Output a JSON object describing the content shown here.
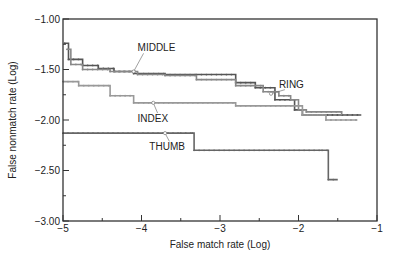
{
  "chart_data": {
    "type": "line",
    "title": "",
    "xlabel": "False match rate (Log)",
    "ylabel": "False nonmatch rate (Log)",
    "xlim": [
      -5,
      -1
    ],
    "ylim": [
      -3.0,
      -1.0
    ],
    "xticks": [
      -5,
      -4,
      -3,
      -2,
      -1
    ],
    "xtick_labels": [
      "−5",
      "−4",
      "−3",
      "−2",
      "−1"
    ],
    "yticks": [
      -1.0,
      -1.5,
      -2.0,
      -2.5,
      -3.0
    ],
    "ytick_labels": [
      "−1.00",
      "−1.50",
      "−2.00",
      "−2.50",
      "−3.00"
    ],
    "grid": false,
    "legend": "none (inline annotations)",
    "series": [
      {
        "name": "MIDDLE",
        "color": "#555555",
        "step": true,
        "points": [
          [
            -4.98,
            -1.24
          ],
          [
            -4.93,
            -1.4
          ],
          [
            -4.75,
            -1.46
          ],
          [
            -4.55,
            -1.49
          ],
          [
            -4.35,
            -1.52
          ],
          [
            -4.1,
            -1.54
          ],
          [
            -3.7,
            -1.55
          ],
          [
            -3.3,
            -1.55
          ],
          [
            -2.8,
            -1.63
          ],
          [
            -2.55,
            -1.68
          ],
          [
            -2.3,
            -1.8
          ],
          [
            -2.05,
            -1.9
          ],
          [
            -1.95,
            -1.95
          ],
          [
            -1.2,
            -1.95
          ]
        ]
      },
      {
        "name": "RING",
        "color": "#888888",
        "step": true,
        "points": [
          [
            -4.95,
            -1.3
          ],
          [
            -4.9,
            -1.45
          ],
          [
            -4.75,
            -1.5
          ],
          [
            -4.4,
            -1.52
          ],
          [
            -4.05,
            -1.55
          ],
          [
            -3.7,
            -1.56
          ],
          [
            -3.3,
            -1.6
          ],
          [
            -2.8,
            -1.66
          ],
          [
            -2.45,
            -1.72
          ],
          [
            -2.25,
            -1.76
          ],
          [
            -2.1,
            -1.8
          ],
          [
            -2.0,
            -1.9
          ],
          [
            -1.9,
            -1.92
          ],
          [
            -1.45,
            -1.95
          ]
        ]
      },
      {
        "name": "INDEX",
        "color": "#999999",
        "step": true,
        "points": [
          [
            -5.0,
            -1.62
          ],
          [
            -4.8,
            -1.66
          ],
          [
            -4.4,
            -1.76
          ],
          [
            -4.1,
            -1.83
          ],
          [
            -3.6,
            -1.83
          ],
          [
            -2.8,
            -1.86
          ],
          [
            -2.0,
            -1.86
          ],
          [
            -1.95,
            -1.95
          ],
          [
            -1.65,
            -2.0
          ],
          [
            -1.25,
            -2.0
          ]
        ]
      },
      {
        "name": "THUMB",
        "color": "#666666",
        "step": true,
        "points": [
          [
            -5.0,
            -2.13
          ],
          [
            -3.5,
            -2.13
          ],
          [
            -3.35,
            -2.13
          ],
          [
            -3.33,
            -2.3
          ],
          [
            -1.7,
            -2.3
          ],
          [
            -1.62,
            -2.59
          ],
          [
            -1.5,
            -2.59
          ]
        ]
      }
    ],
    "annotations": [
      {
        "text": "MIDDLE",
        "x": -4.05,
        "y": -1.32,
        "points_to": [
          -4.1,
          -1.52
        ]
      },
      {
        "text": "RING",
        "x": -2.25,
        "y": -1.68,
        "points_to": [
          -2.35,
          -1.74
        ]
      },
      {
        "text": "INDEX",
        "x": -4.05,
        "y": -2.02,
        "points_to": [
          -3.85,
          -1.83
        ]
      },
      {
        "text": "THUMB",
        "x": -3.9,
        "y": -2.3,
        "points_to": [
          -3.7,
          -2.13
        ]
      }
    ]
  }
}
